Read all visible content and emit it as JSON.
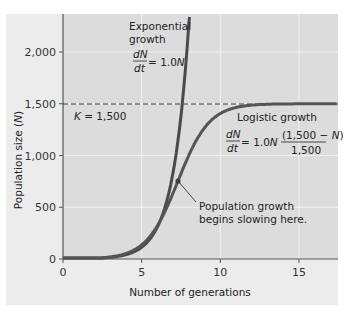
{
  "chart_data": {
    "type": "line",
    "title": "",
    "xlabel": "Number of generations",
    "ylabel": "Population size (N)",
    "xlim": [
      0,
      17.5
    ],
    "ylim": [
      0,
      2300
    ],
    "x_ticks": [
      "0",
      "5",
      "10",
      "15"
    ],
    "y_ticks": [
      "0",
      "500",
      "1,000",
      "1,500",
      "2,000"
    ],
    "grid": true,
    "series": [
      {
        "name": "Exponential growth",
        "equation": "dN/dt = 1.0N",
        "x": [
          0,
          1,
          2,
          3,
          4,
          5,
          6,
          7,
          7.5,
          8.0
        ],
        "values": [
          1,
          2,
          6,
          15,
          42,
          114,
          309,
          839,
          1383,
          2280
        ]
      },
      {
        "name": "Logistic growth",
        "equation": "dN/dt = 1.0N (1,500 − N)/1,500",
        "x": [
          0,
          1,
          2,
          3,
          4,
          5,
          6,
          7,
          7.3,
          8,
          9,
          10,
          11,
          12,
          13,
          14,
          15,
          16,
          17.5
        ],
        "values": [
          1,
          3,
          7,
          20,
          53,
          136,
          323,
          638,
          750,
          998,
          1268,
          1409,
          1466,
          1487,
          1495,
          1498,
          1499,
          1500,
          1500
        ]
      }
    ],
    "annotations": [
      {
        "text": "K = 1,500",
        "type": "dashed-hline",
        "y": 1500
      },
      {
        "text": "Population growth begins slowing here.",
        "type": "pointer",
        "x": 7.3,
        "y": 750
      }
    ]
  },
  "labels": {
    "xlabel": "Number of generations",
    "ylabel_prefix": "Population size (",
    "ylabel_var": "N",
    "ylabel_suffix": ")",
    "x_ticks": [
      "0",
      "5",
      "10",
      "15"
    ],
    "y_ticks": [
      "0",
      "500",
      "1,000",
      "1,500",
      "2,000"
    ],
    "exp_line1": "Exponential",
    "exp_line2": "growth",
    "exp_num": "dN",
    "exp_den": "dt",
    "exp_rhs_a": "= 1.0",
    "exp_rhs_b": "N",
    "log_title": "Logistic growth",
    "log_num": "dN",
    "log_den": "dt",
    "log_rhs_a": "= 1.0",
    "log_rhs_b": "N",
    "log_frac_num_a": "(1,500 − ",
    "log_frac_num_b": "N",
    "log_frac_num_c": ")",
    "log_frac_den": "1,500",
    "k_label_a": "K",
    "k_label_b": " = 1,500",
    "pointer_line1": "Population growth",
    "pointer_line2": "begins slowing here."
  },
  "colors": {
    "outer_bg": "#ececec",
    "plot_bg": "#dcdcdc",
    "grid": "#f4f4f4",
    "curve": "#4a4a4a",
    "axis": "#555555"
  }
}
